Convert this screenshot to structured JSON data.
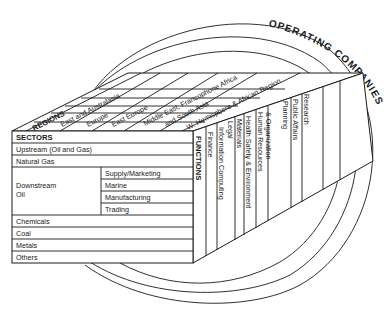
{
  "diagram": {
    "outer_label": "OPERATING COMPANIES",
    "regions": {
      "title": "REGIONS",
      "items": [
        "East and Australasia",
        "Europe",
        "East Europe",
        "Middle East, Francophone Africa",
        "and South Asia",
        "W. Hemisphere & African Region"
      ]
    },
    "sectors": {
      "title": "SECTORS",
      "items": [
        "Upstream (Oil and Gas)",
        "Natural Gas",
        "Downstream",
        "Oil",
        "Chemicals",
        "Coal",
        "Metals",
        "Others"
      ],
      "downstream_sub": [
        "Supply/Marketing",
        "Marine",
        "Manufacturing",
        "Trading"
      ]
    },
    "functions": {
      "title": "FUNCTIONS",
      "items": [
        "Finance",
        "Information Computing",
        "Legal",
        "Materials",
        "Health Safety & Environment",
        "Human Resources",
        "& Organization",
        "Planning",
        "Public Affairs",
        "Research"
      ]
    }
  }
}
